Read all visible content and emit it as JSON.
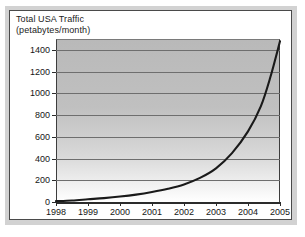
{
  "chart_data": {
    "type": "line",
    "title": "Total USA Traffic",
    "subtitle": "(petabytes/month)",
    "xlabel": "",
    "ylabel": "",
    "x": [
      1998,
      1999,
      2000,
      2001,
      2002,
      2003,
      2004,
      2005
    ],
    "xticklabels": [
      "1998",
      "1999",
      "2000",
      "2001",
      "2002",
      "2003",
      "2004",
      "2005"
    ],
    "yticks": [
      0,
      200,
      400,
      600,
      800,
      1000,
      1200,
      1400
    ],
    "yticklabels": [
      "0",
      "200",
      "400",
      "600",
      "800",
      "1000",
      "1200",
      "1400"
    ],
    "xlim": [
      1998,
      2005
    ],
    "ylim": [
      0,
      1500
    ],
    "grid": "horizontal",
    "legend": "none",
    "series": [
      {
        "name": "Total USA Traffic",
        "color": "#1a1a1a",
        "values": [
          10,
          25,
          50,
          90,
          160,
          310,
          650,
          1480
        ]
      }
    ],
    "dense_points": [
      [
        1998.0,
        8
      ],
      [
        1998.5,
        14
      ],
      [
        1999.0,
        25
      ],
      [
        1999.5,
        36
      ],
      [
        2000.0,
        50
      ],
      [
        2000.5,
        68
      ],
      [
        2001.0,
        92
      ],
      [
        2001.5,
        122
      ],
      [
        2002.0,
        162
      ],
      [
        2002.5,
        222
      ],
      [
        2003.0,
        310
      ],
      [
        2003.5,
        450
      ],
      [
        2004.0,
        650
      ],
      [
        2004.4,
        880
      ],
      [
        2004.7,
        1150
      ],
      [
        2005.0,
        1480
      ]
    ],
    "colors": {
      "curve": "#1a1a1a",
      "plot_fill_top": "#b9b9b9",
      "plot_fill_bottom": "#ffffff",
      "gridline": "#6e6e6e",
      "axis": "#2b2b2b",
      "card_border": "#4a4a4a",
      "mat": "#d2d2d2",
      "text": "#161616"
    }
  }
}
